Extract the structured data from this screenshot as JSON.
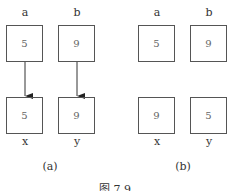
{
  "panels": [
    {
      "caption": "(a)",
      "top": [
        {
          "label": "a",
          "value": "5"
        },
        {
          "label": "b",
          "value": "9"
        }
      ],
      "bottom": [
        {
          "label": "x",
          "value": "5"
        },
        {
          "label": "y",
          "value": "9"
        }
      ],
      "arrows": true
    },
    {
      "caption": "(b)",
      "top": [
        {
          "label": "a",
          "value": "5"
        },
        {
          "label": "b",
          "value": "9"
        }
      ],
      "bottom": [
        {
          "label": "x",
          "value": "9"
        },
        {
          "label": "y",
          "value": "5"
        }
      ],
      "arrows": false
    }
  ],
  "figure_caption": "图 7.9"
}
